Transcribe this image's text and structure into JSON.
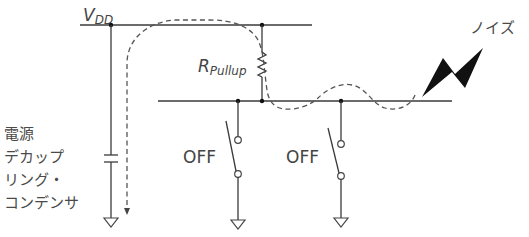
{
  "diagram": {
    "labels": {
      "vdd_main": "V",
      "vdd_sub": "DD",
      "resistor_main": "R",
      "resistor_sub": "Pullup",
      "noise": "ノイズ",
      "switch_left": "OFF",
      "switch_right": "OFF",
      "capacitor_line1": "電源",
      "capacitor_line2": "デカップ",
      "capacitor_line3": "リング・",
      "capacitor_line4": "コンデンサ"
    },
    "colors": {
      "line": "#3a3a3a",
      "dashed_path": "#555555",
      "text": "#444444",
      "noise_bolt": "#111111",
      "background": "#ffffff"
    },
    "components": [
      {
        "type": "supply_rail",
        "name": "VDD"
      },
      {
        "type": "resistor",
        "name": "R_Pullup"
      },
      {
        "type": "capacitor",
        "name": "power decoupling capacitor"
      },
      {
        "type": "switch",
        "name": "switch-left",
        "state": "OFF"
      },
      {
        "type": "switch",
        "name": "switch-right",
        "state": "OFF"
      },
      {
        "type": "noise_source",
        "name": "noise"
      }
    ]
  }
}
